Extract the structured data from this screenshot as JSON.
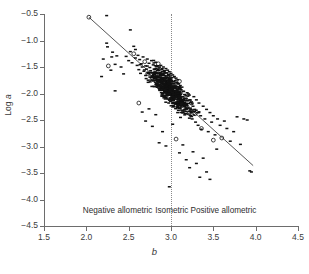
{
  "chart_data": {
    "type": "scatter",
    "title": "",
    "xlabel": "b",
    "ylabel": "Log a",
    "xlim": [
      1.5,
      4.5
    ],
    "ylim": [
      -4.5,
      -0.5
    ],
    "grid": false,
    "legend": null,
    "x_ticks": [
      "1.5",
      "2.0",
      "2.5",
      "3.0",
      "3.5",
      "4.0",
      "4.5"
    ],
    "x_tick_values": [
      1.5,
      2.0,
      2.5,
      3.0,
      3.5,
      4.0,
      4.5
    ],
    "y_ticks": [
      "−0.5",
      "−1.0",
      "−1.5",
      "−2.0",
      "−2.5",
      "−3.0",
      "−3.5",
      "−4.0",
      "−4.5"
    ],
    "y_tick_values": [
      -0.5,
      -1.0,
      -1.5,
      -2.0,
      -2.5,
      -3.0,
      -3.5,
      -4.0,
      -4.5
    ],
    "marker_color": "#111111",
    "line_color": "#555555",
    "reference_line_color": "#8a8a8a",
    "annotations": [
      {
        "text": "Negative allometric",
        "x": 2.37,
        "y": -4.22
      },
      {
        "text": "Isometric",
        "x": 3.01,
        "y": -4.22
      },
      {
        "text": "Positive allometric",
        "x": 3.62,
        "y": -4.22
      }
    ],
    "reference_lines": [
      {
        "name": "isometry",
        "orientation": "vertical",
        "value": 3.0,
        "style": "dotted"
      }
    ],
    "fit_line": {
      "name": "regression",
      "style": "solid",
      "x_start": 2.03,
      "y_start": -0.56,
      "x_end": 3.97,
      "y_end": -3.36,
      "slope": -1.443,
      "intercept": 2.37
    },
    "series": [
      {
        "name": "species",
        "n_points": 720,
        "x": [
          2.03,
          2.24,
          2.24,
          2.25,
          2.52,
          2.56,
          2.58,
          2.2,
          2.3,
          2.34,
          2.18,
          2.26,
          2.29,
          2.31,
          2.34,
          2.36,
          2.41,
          2.44,
          2.47,
          2.5,
          2.52,
          2.54,
          2.56,
          2.58,
          2.6,
          2.61,
          2.62,
          2.63,
          2.64,
          2.65,
          2.66,
          2.67,
          2.68,
          2.69,
          2.7,
          2.7,
          2.71,
          2.72,
          2.73,
          2.74,
          2.75,
          2.75,
          2.76,
          2.77,
          2.78,
          2.79,
          2.8,
          2.8,
          2.81,
          2.82,
          2.83,
          2.83,
          2.84,
          2.84,
          2.85,
          2.85,
          2.86,
          2.86,
          2.87,
          2.87,
          2.88,
          2.88,
          2.89,
          2.89,
          2.9,
          2.9,
          2.91,
          2.91,
          2.92,
          2.92,
          2.93,
          2.93,
          2.94,
          2.94,
          2.95,
          2.95,
          2.95,
          2.96,
          2.96,
          2.96,
          2.97,
          2.97,
          2.97,
          2.98,
          2.98,
          2.98,
          2.99,
          2.99,
          2.99,
          3.0,
          3.0,
          3.0,
          3.0,
          3.01,
          3.01,
          3.01,
          3.02,
          3.02,
          3.02,
          3.03,
          3.03,
          3.03,
          3.04,
          3.04,
          3.04,
          3.05,
          3.05,
          3.05,
          3.06,
          3.06,
          3.06,
          3.07,
          3.07,
          3.07,
          3.08,
          3.08,
          3.08,
          3.09,
          3.09,
          3.09,
          3.1,
          3.1,
          3.1,
          3.11,
          3.11,
          3.12,
          3.12,
          3.13,
          3.13,
          3.14,
          3.14,
          3.15,
          3.15,
          3.16,
          3.16,
          3.17,
          3.17,
          3.18,
          3.19,
          3.2,
          3.21,
          3.22,
          3.23,
          3.24,
          3.25,
          3.26,
          3.27,
          3.28,
          3.29,
          3.3,
          3.31,
          3.32,
          3.33,
          3.35,
          3.36,
          3.38,
          3.4,
          3.42,
          3.44,
          3.46,
          3.48,
          3.5,
          3.52,
          3.55,
          3.58,
          3.6,
          3.63,
          3.66,
          3.7,
          3.74,
          3.78,
          3.82,
          3.86,
          3.9,
          3.93,
          3.95,
          2.62,
          2.66,
          2.7,
          2.74,
          2.78,
          2.82,
          2.86,
          2.9,
          2.94,
          2.98,
          3.02,
          3.06,
          3.1,
          3.14,
          3.18,
          3.22,
          3.26,
          3.3,
          3.34,
          3.38,
          3.42,
          3.46,
          3.5,
          3.54
        ],
        "y": [
          -0.56,
          -0.53,
          -1.05,
          -1.12,
          -0.8,
          -1.11,
          -1.17,
          -1.35,
          -1.31,
          -1.45,
          -1.68,
          -1.48,
          -1.56,
          -1.22,
          -1.95,
          -1.29,
          -1.5,
          -1.63,
          -1.3,
          -1.38,
          -1.21,
          -1.42,
          -1.25,
          -1.33,
          -1.47,
          -1.28,
          -1.55,
          -1.36,
          -1.62,
          -1.44,
          -1.5,
          -1.31,
          -1.58,
          -1.4,
          -1.66,
          -1.48,
          -1.54,
          -1.35,
          -1.61,
          -1.43,
          -1.69,
          -1.51,
          -1.57,
          -1.38,
          -1.64,
          -1.46,
          -1.72,
          -1.54,
          -1.6,
          -1.41,
          -1.67,
          -1.49,
          -1.75,
          -1.57,
          -1.63,
          -1.44,
          -1.7,
          -1.52,
          -1.78,
          -1.6,
          -1.66,
          -1.47,
          -1.73,
          -1.55,
          -1.81,
          -1.63,
          -1.69,
          -1.5,
          -1.76,
          -1.58,
          -1.84,
          -1.66,
          -1.72,
          -1.53,
          -1.79,
          -1.61,
          -1.87,
          -1.69,
          -1.75,
          -1.56,
          -1.82,
          -1.64,
          -1.9,
          -1.72,
          -1.78,
          -1.59,
          -1.85,
          -1.67,
          -1.93,
          -1.75,
          -1.81,
          -1.62,
          -1.88,
          -1.7,
          -1.96,
          -1.78,
          -1.84,
          -1.65,
          -1.91,
          -1.73,
          -1.99,
          -1.81,
          -1.87,
          -1.68,
          -1.94,
          -1.76,
          -2.02,
          -1.84,
          -1.9,
          -1.71,
          -1.97,
          -1.79,
          -2.05,
          -1.87,
          -1.93,
          -1.74,
          -2.0,
          -1.82,
          -2.08,
          -1.9,
          -1.96,
          -1.77,
          -2.03,
          -1.85,
          -2.11,
          -1.93,
          -1.99,
          -2.16,
          -1.88,
          -2.06,
          -2.22,
          -1.96,
          -2.14,
          -2.3,
          -2.02,
          -2.2,
          -2.38,
          -2.1,
          -2.28,
          -2.05,
          -2.34,
          -2.12,
          -2.42,
          -2.18,
          -2.48,
          -2.24,
          -2.06,
          -2.3,
          -2.54,
          -2.12,
          -2.36,
          -2.6,
          -2.18,
          -2.42,
          -2.66,
          -2.24,
          -2.48,
          -2.3,
          -2.72,
          -2.36,
          -2.54,
          -2.42,
          -2.78,
          -2.48,
          -2.6,
          -2.84,
          -2.52,
          -2.66,
          -2.9,
          -2.72,
          -2.44,
          -2.96,
          -2.48,
          -2.5,
          -3.46,
          -3.48,
          -2.18,
          -2.35,
          -2.52,
          -2.29,
          -2.62,
          -2.4,
          -2.93,
          -2.72,
          -2.99,
          -3.76,
          -2.58,
          -2.86,
          -3.12,
          -2.97,
          -3.25,
          -3.4,
          -3.1,
          -3.32,
          -3.58,
          -3.22,
          -3.48,
          -3.62,
          -2.88,
          -3.05
        ]
      }
    ]
  },
  "axes": {
    "y_title": "Log a",
    "y_title_prefix": "Log ",
    "y_title_var": "a",
    "x_title": "b"
  }
}
